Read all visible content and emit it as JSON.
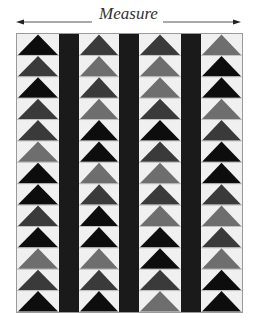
{
  "diagram": {
    "label": "Measure",
    "arrow_icon_left": "arrow-left-icon",
    "arrow_icon_right": "arrow-right-icon"
  },
  "quilt": {
    "rows": 13,
    "columns": 4,
    "sashing_strips": 3,
    "colors": {
      "background": "#f0f0f0",
      "sashing": "#1a1a1a",
      "black": "#0d0d0d",
      "dark": "#3a3a3a",
      "mid": "#6e6e6e",
      "seam": "#9a9a9a"
    },
    "goose_columns": [
      [
        "black",
        "dark",
        "black",
        "dark",
        "dark",
        "mid",
        "black",
        "black",
        "dark",
        "black",
        "mid",
        "dark",
        "black"
      ],
      [
        "dark",
        "mid",
        "dark",
        "mid",
        "black",
        "black",
        "mid",
        "dark",
        "black",
        "black",
        "mid",
        "dark",
        "black"
      ],
      [
        "dark",
        "mid",
        "mid",
        "dark",
        "black",
        "dark",
        "mid",
        "dark",
        "mid",
        "black",
        "black",
        "dark",
        "mid"
      ],
      [
        "mid",
        "black",
        "black",
        "mid",
        "dark",
        "black",
        "black",
        "dark",
        "mid",
        "dark",
        "mid",
        "black",
        "black"
      ]
    ]
  }
}
